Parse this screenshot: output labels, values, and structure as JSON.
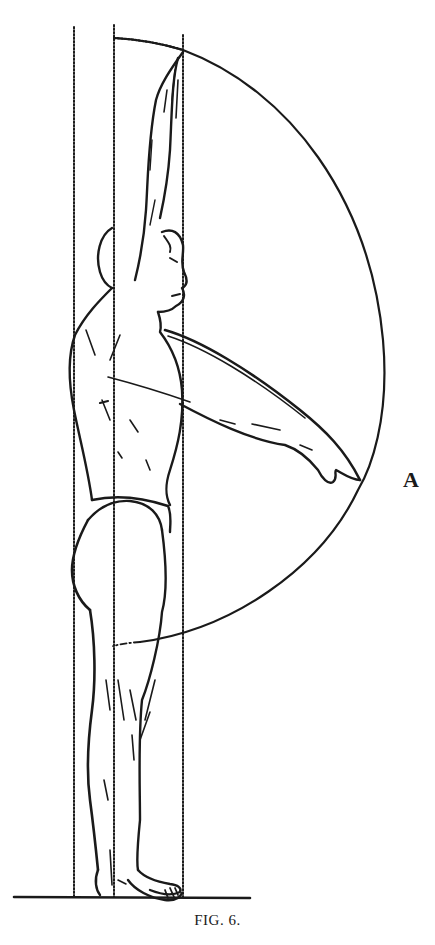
{
  "figure": {
    "caption": "FIG. 6.",
    "point_label": "A",
    "colors": {
      "ink": "#1a1a1a",
      "background": "#ffffff"
    }
  }
}
